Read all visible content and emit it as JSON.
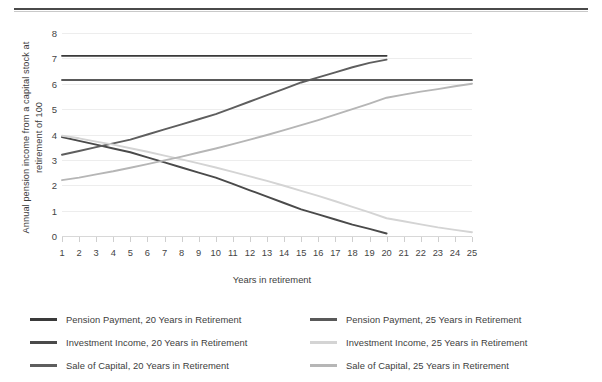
{
  "chart_data": {
    "type": "line",
    "title": "",
    "xlabel": "Years in retirement",
    "ylabel": "Annual pension income from a capital stock at retirement of 100",
    "xlim": [
      1,
      25
    ],
    "ylim": [
      0,
      8
    ],
    "xticks": [
      1,
      2,
      3,
      4,
      5,
      6,
      7,
      8,
      9,
      10,
      11,
      12,
      13,
      14,
      15,
      16,
      17,
      18,
      19,
      20,
      21,
      22,
      23,
      24,
      25
    ],
    "yticks": [
      0,
      1,
      2,
      3,
      4,
      5,
      6,
      7,
      8
    ],
    "grid": true,
    "legend_position": "bottom",
    "legend_columns": 2,
    "x": [
      1,
      2,
      3,
      4,
      5,
      6,
      7,
      8,
      9,
      10,
      11,
      12,
      13,
      14,
      15,
      16,
      17,
      18,
      19,
      20,
      21,
      22,
      23,
      24,
      25
    ],
    "series": [
      {
        "name": "Pension Payment, 20 Years in Retirement",
        "color": "#3a3a3a",
        "x": [
          1,
          2,
          3,
          4,
          5,
          6,
          7,
          8,
          9,
          10,
          11,
          12,
          13,
          14,
          15,
          16,
          17,
          18,
          19,
          20
        ],
        "values": [
          7.1,
          7.1,
          7.1,
          7.1,
          7.1,
          7.1,
          7.1,
          7.1,
          7.1,
          7.1,
          7.1,
          7.1,
          7.1,
          7.1,
          7.1,
          7.1,
          7.1,
          7.1,
          7.1,
          7.1
        ]
      },
      {
        "name": "Investment Income, 20 Years in Retirement",
        "color": "#4a4a4a",
        "x": [
          1,
          2,
          3,
          4,
          5,
          6,
          7,
          8,
          9,
          10,
          11,
          12,
          13,
          14,
          15,
          16,
          17,
          18,
          19,
          20
        ],
        "values": [
          3.9,
          3.75,
          3.6,
          3.45,
          3.3,
          3.1,
          2.9,
          2.7,
          2.5,
          2.3,
          2.05,
          1.8,
          1.55,
          1.3,
          1.05,
          0.85,
          0.65,
          0.45,
          0.28,
          0.1
        ]
      },
      {
        "name": "Sale of Capital, 20 Years in Retirement",
        "color": "#5e5e5e",
        "x": [
          1,
          2,
          3,
          4,
          5,
          6,
          7,
          8,
          9,
          10,
          11,
          12,
          13,
          14,
          15,
          16,
          17,
          18,
          19,
          20
        ],
        "values": [
          3.2,
          3.35,
          3.5,
          3.65,
          3.8,
          4.0,
          4.2,
          4.4,
          4.6,
          4.8,
          5.05,
          5.3,
          5.55,
          5.8,
          6.05,
          6.25,
          6.45,
          6.65,
          6.82,
          6.95
        ]
      },
      {
        "name": "Pension Payment, 25 Years in Retirement",
        "color": "#595959",
        "x": [
          1,
          2,
          3,
          4,
          5,
          6,
          7,
          8,
          9,
          10,
          11,
          12,
          13,
          14,
          15,
          16,
          17,
          18,
          19,
          20,
          21,
          22,
          23,
          24,
          25
        ],
        "values": [
          6.15,
          6.15,
          6.15,
          6.15,
          6.15,
          6.15,
          6.15,
          6.15,
          6.15,
          6.15,
          6.15,
          6.15,
          6.15,
          6.15,
          6.15,
          6.15,
          6.15,
          6.15,
          6.15,
          6.15,
          6.15,
          6.15,
          6.15,
          6.15,
          6.15
        ]
      },
      {
        "name": "Investment Income, 25 Years in Retirement",
        "color": "#d4d4d4",
        "x": [
          1,
          2,
          3,
          4,
          5,
          6,
          7,
          8,
          9,
          10,
          11,
          12,
          13,
          14,
          15,
          16,
          17,
          18,
          19,
          20,
          21,
          22,
          23,
          24,
          25
        ],
        "values": [
          3.95,
          3.85,
          3.72,
          3.6,
          3.46,
          3.32,
          3.17,
          3.02,
          2.86,
          2.7,
          2.53,
          2.35,
          2.17,
          1.98,
          1.78,
          1.58,
          1.37,
          1.15,
          0.93,
          0.7,
          0.58,
          0.46,
          0.34,
          0.24,
          0.15
        ]
      },
      {
        "name": "Sale of Capital, 25 Years in Retirement",
        "color": "#b6b6b6",
        "x": [
          1,
          2,
          3,
          4,
          5,
          6,
          7,
          8,
          9,
          10,
          11,
          12,
          13,
          14,
          15,
          16,
          17,
          18,
          19,
          20,
          21,
          22,
          23,
          24,
          25
        ],
        "values": [
          2.2,
          2.3,
          2.43,
          2.55,
          2.69,
          2.83,
          2.98,
          3.13,
          3.29,
          3.45,
          3.62,
          3.8,
          3.98,
          4.17,
          4.37,
          4.57,
          4.78,
          5.0,
          5.22,
          5.45,
          5.57,
          5.69,
          5.79,
          5.9,
          6.0
        ]
      }
    ],
    "legend": [
      {
        "label": "Pension Payment, 20 Years in Retirement",
        "color": "#3a3a3a"
      },
      {
        "label": "Pension Payment, 25 Years in Retirement",
        "color": "#595959"
      },
      {
        "label": "Investment Income, 20 Years in Retirement",
        "color": "#4a4a4a"
      },
      {
        "label": "Investment Income, 25 Years in Retirement",
        "color": "#d4d4d4"
      },
      {
        "label": "Sale of Capital, 20 Years in Retirement",
        "color": "#5e5e5e"
      },
      {
        "label": "Sale of Capital, 25 Years in Retirement",
        "color": "#b6b6b6"
      }
    ]
  },
  "figure": {
    "y_axis_title": "Annual pension income from a capital stock at retirement of 100",
    "x_axis_title": "Years in retirement"
  }
}
